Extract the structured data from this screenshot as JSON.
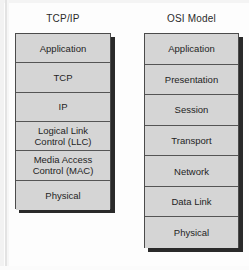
{
  "diagram": {
    "background_color": "#fdfdfd",
    "box_fill_color": "#d5d5d5",
    "box_border_color": "#4b4b4b",
    "shadow_color": "#2a2a2a",
    "text_color": "#242424"
  },
  "stacks": [
    {
      "id": "tcpip",
      "title": "TCP/IP",
      "layers": [
        {
          "lines": [
            "Application"
          ]
        },
        {
          "lines": [
            "TCP"
          ]
        },
        {
          "lines": [
            "IP"
          ]
        },
        {
          "lines": [
            "Logical  Link",
            "Control (LLC)"
          ]
        },
        {
          "lines": [
            "Media Access",
            "Control (MAC)"
          ]
        },
        {
          "lines": [
            "Physical"
          ]
        }
      ]
    },
    {
      "id": "osi",
      "title": "OSI Model",
      "layers": [
        {
          "lines": [
            "Application"
          ]
        },
        {
          "lines": [
            "Presentation"
          ]
        },
        {
          "lines": [
            "Session"
          ]
        },
        {
          "lines": [
            "Transport"
          ]
        },
        {
          "lines": [
            "Network"
          ]
        },
        {
          "lines": [
            "Data Link"
          ]
        },
        {
          "lines": [
            "Physical"
          ]
        }
      ]
    }
  ]
}
